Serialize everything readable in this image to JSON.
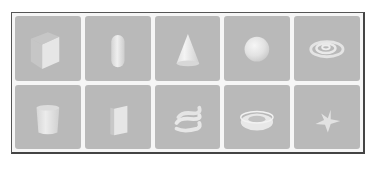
{
  "gallery": {
    "colors": {
      "tile_bg": "#b9b9b9",
      "shape_light": "#ebebeb",
      "shape_mid": "#d6d6d6",
      "shape_dark": "#c4c4c4",
      "frame_border": "#444444"
    },
    "items": [
      {
        "shape": "cube",
        "icon": "cube-icon"
      },
      {
        "shape": "capsule",
        "icon": "capsule-icon"
      },
      {
        "shape": "cone",
        "icon": "cone-icon"
      },
      {
        "shape": "sphere",
        "icon": "sphere-icon"
      },
      {
        "shape": "spiral",
        "icon": "spiral-icon"
      },
      {
        "shape": "cylinder",
        "icon": "cylinder-icon"
      },
      {
        "shape": "panel",
        "icon": "panel-icon"
      },
      {
        "shape": "helix",
        "icon": "helix-icon"
      },
      {
        "shape": "torus",
        "icon": "torus-icon"
      },
      {
        "shape": "star",
        "icon": "star-icon"
      }
    ]
  }
}
